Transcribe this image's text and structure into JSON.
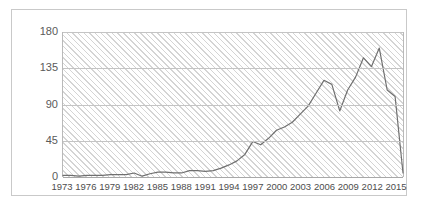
{
  "chart_data": {
    "type": "line",
    "title": "",
    "subtitle": "",
    "xlabel": "",
    "ylabel": "",
    "grid": true,
    "legend": false,
    "legend_position": "none",
    "line_color": "#6f6f6f",
    "plot_background": "#ffffff",
    "plot_hatch_color": "#d4d4d4",
    "gridline_color": "#c4c4c4",
    "border_color": "#c9c9c9",
    "xlim": [
      1973,
      2016
    ],
    "ylim": [
      0,
      180
    ],
    "ytick_values": [
      0,
      45,
      90,
      135,
      180
    ],
    "ytick_labels": [
      "0",
      "45",
      "90",
      "135",
      "180"
    ],
    "xtick_labels": [
      "1973",
      "1976",
      "1979",
      "1982",
      "1985",
      "1988",
      "1991",
      "1994",
      "1997",
      "2000",
      "2003",
      "2006",
      "2009",
      "2012",
      "2015"
    ],
    "xtick_values": [
      1973,
      1976,
      1979,
      1982,
      1985,
      1988,
      1991,
      1994,
      1997,
      2000,
      2003,
      2006,
      2009,
      2012,
      2015
    ],
    "x": [
      1973,
      1974,
      1975,
      1976,
      1977,
      1978,
      1979,
      1980,
      1981,
      1982,
      1983,
      1984,
      1985,
      1986,
      1987,
      1988,
      1989,
      1990,
      1991,
      1992,
      1993,
      1994,
      1995,
      1996,
      1997,
      1998,
      1999,
      2000,
      2001,
      2002,
      2003,
      2004,
      2005,
      2006,
      2007,
      2008,
      2009,
      2010,
      2011,
      2012,
      2013,
      2014,
      2015,
      2016
    ],
    "values": [
      2,
      2,
      1,
      2,
      2,
      2,
      3,
      3,
      3,
      5,
      1,
      4,
      6,
      6,
      5,
      5,
      8,
      8,
      7,
      8,
      11,
      15,
      20,
      28,
      44,
      40,
      48,
      58,
      62,
      68,
      78,
      88,
      104,
      120,
      115,
      82,
      108,
      124,
      148,
      137,
      160,
      108,
      100,
      5
    ],
    "series": [
      {
        "name": "series-1",
        "values": [
          2,
          2,
          1,
          2,
          2,
          2,
          3,
          3,
          3,
          5,
          1,
          4,
          6,
          6,
          5,
          5,
          8,
          8,
          7,
          8,
          11,
          15,
          20,
          28,
          44,
          40,
          48,
          58,
          62,
          68,
          78,
          88,
          104,
          120,
          115,
          82,
          108,
          124,
          148,
          137,
          160,
          108,
          100,
          5
        ]
      }
    ]
  }
}
